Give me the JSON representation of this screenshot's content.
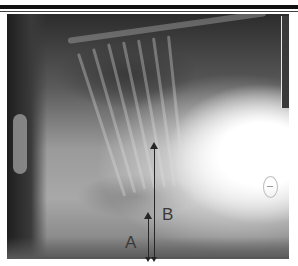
{
  "figure": {
    "type": "lateral thoracic radiograph",
    "annotations": {
      "arrow_a": {
        "label": "A",
        "color": "#262626"
      },
      "arrow_b": {
        "label": "B",
        "color": "#262626"
      }
    },
    "marker": {
      "shape": "circle-with-dash",
      "color": "#bdbdbd"
    },
    "scale_bar": {
      "color": "#3a3a3a"
    },
    "colors": {
      "background": "#ffffff",
      "border": "#111111",
      "film_dark": "#2c2c2c",
      "film_light": "#ffffff"
    }
  }
}
